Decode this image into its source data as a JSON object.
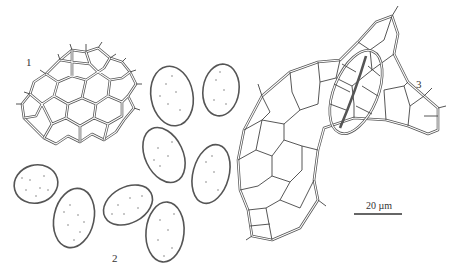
{
  "figure": {
    "panels": [
      {
        "label": "1",
        "description": "reticulate net of polygonal cells with spiny projections"
      },
      {
        "label": "2",
        "description": "group of ellipsoid punctate spores with spiny margin"
      },
      {
        "label": "3",
        "description": "irregular lobed epidermis with polygonal cells and elongated stoma-like cell pair"
      }
    ],
    "scale_bar": {
      "label": "20 µm"
    }
  }
}
